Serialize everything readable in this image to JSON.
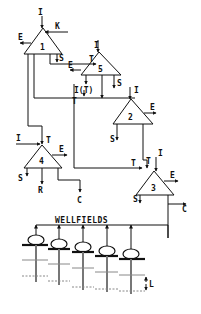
{
  "diagram": {
    "title": "WELLFIELDS",
    "colors": {
      "ink": "#111111",
      "well": "#555555",
      "level": "#888888",
      "background": "#ffffff"
    },
    "nodes": [
      {
        "id": "1",
        "label": "1",
        "in": [
          "I",
          "K"
        ],
        "out": [
          "E",
          "S"
        ]
      },
      {
        "id": "5",
        "label": "5",
        "in": [
          "I",
          "T"
        ],
        "out": [
          "E",
          "S",
          "I(T)"
        ]
      },
      {
        "id": "2",
        "label": "2",
        "in": [
          "I",
          "T"
        ],
        "out": [
          "E",
          "S"
        ]
      },
      {
        "id": "4",
        "label": "4",
        "in": [
          "I",
          "T"
        ],
        "out": [
          "E",
          "S",
          "R",
          "C"
        ]
      },
      {
        "id": "3",
        "label": "3",
        "in": [
          "I",
          "T",
          "T"
        ],
        "out": [
          "E",
          "S",
          "C"
        ]
      }
    ],
    "labels": {
      "n1_I": "I",
      "n1_K": "K",
      "n1_E": "E",
      "n1_S": "S",
      "n5_I": "I",
      "n5_T": "T",
      "n5_E": "E",
      "n5_S": "S",
      "n5_IT": "I(T)",
      "n2_T": "T",
      "n2_I": "I",
      "n2_E": "E",
      "n2_S": "S",
      "n4_I": "I",
      "n4_T": "T",
      "n4_E": "E",
      "n4_S": "S",
      "n4_R": "R",
      "n4_C": "C",
      "n3_T1": "T",
      "n3_T2": "T",
      "n3_I": "I",
      "n3_E": "E",
      "n3_S": "S",
      "n3_C": "C",
      "level_L": "L"
    },
    "wells": {
      "count": 5
    }
  }
}
